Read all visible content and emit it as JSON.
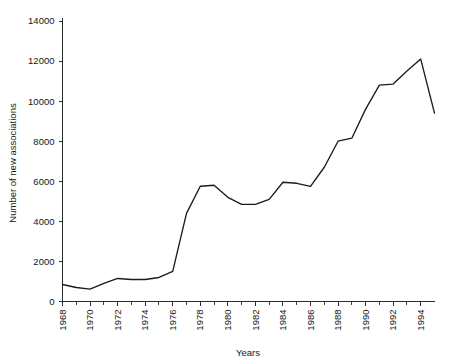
{
  "chart_data": {
    "type": "line",
    "title": "",
    "xlabel": "Years",
    "ylabel": "Number of new associations",
    "xlim": [
      1968,
      1995
    ],
    "ylim": [
      0,
      14000
    ],
    "grid": false,
    "legend": null,
    "y_ticks": [
      0,
      2000,
      4000,
      6000,
      8000,
      10000,
      12000,
      14000
    ],
    "y_tick_labels": [
      "0",
      "2000",
      "4000",
      "6000",
      "8000",
      "10000",
      "12000",
      "14000"
    ],
    "x_ticks": [
      1968,
      1970,
      1972,
      1974,
      1976,
      1978,
      1980,
      1982,
      1984,
      1986,
      1988,
      1990,
      1992,
      1994
    ],
    "x_tick_labels": [
      "1968",
      "1970",
      "1972",
      "1974",
      "1976",
      "1978",
      "1980",
      "1982",
      "1984",
      "1986",
      "1988",
      "1990",
      "1992",
      "1994"
    ],
    "x_minor_tick_step": 1,
    "x_tick_label_rotation": -90,
    "series": [
      {
        "name": "Number of new associations",
        "color": "#1b1b1b",
        "x": [
          1968,
          1969,
          1970,
          1971,
          1972,
          1973,
          1974,
          1975,
          1976,
          1977,
          1978,
          1979,
          1980,
          1981,
          1982,
          1983,
          1984,
          1985,
          1986,
          1987,
          1988,
          1989,
          1990,
          1991,
          1992,
          1993,
          1994,
          1995
        ],
        "values": [
          850,
          700,
          620,
          900,
          1150,
          1100,
          1100,
          1200,
          1500,
          4400,
          5750,
          5800,
          5200,
          4850,
          4850,
          5100,
          5950,
          5900,
          5750,
          6700,
          8000,
          8150,
          9600,
          10800,
          10850,
          11500,
          12100,
          9400
        ]
      }
    ]
  }
}
